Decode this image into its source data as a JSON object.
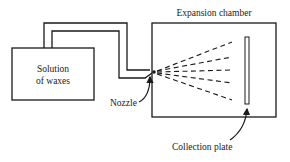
{
  "diagram": {
    "title": "Expansion chamber",
    "components": {
      "solution_box": {
        "line1": "Solution",
        "line2": "of waxes"
      },
      "nozzle": {
        "label": "Nozzle"
      },
      "chamber": {
        "label": "Expansion chamber"
      },
      "collection_plate": {
        "label": "Collection plate"
      }
    },
    "colors": {
      "stroke": "#1a1a1a",
      "background": "#ffffff"
    }
  }
}
